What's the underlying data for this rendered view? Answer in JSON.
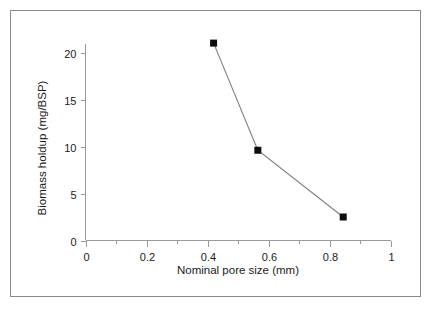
{
  "figure": {
    "frame_color": "#8a8a8a",
    "background_color": "#ffffff",
    "caption": ""
  },
  "chart_data": {
    "type": "line",
    "title": "",
    "subtitle": "",
    "xlabel": "Nominal pore size (mm)",
    "ylabel": "Biomass holdup (mg/BSP)",
    "xlim": [
      0,
      1
    ],
    "ylim": [
      0,
      22
    ],
    "grid": false,
    "legend": null,
    "legend_position": "none",
    "x_ticks": [
      0,
      0.2,
      0.4,
      0.6,
      0.8,
      1
    ],
    "x_tick_labels": [
      "0",
      "0.2",
      "0.4",
      "0.6",
      "0.8",
      "1"
    ],
    "x_minor_ticks": [
      0.1,
      0.3,
      0.5,
      0.7,
      0.9
    ],
    "y_ticks": [
      0,
      5,
      10,
      15,
      20
    ],
    "y_tick_labels": [
      "0",
      "5",
      "10",
      "15",
      "20"
    ],
    "marker": "filled-square",
    "marker_color": "#0d0d0d",
    "line_color": "#7d7d7d",
    "x": [
      0.42,
      0.565,
      0.845
    ],
    "values": [
      21.0,
      9.6,
      2.5
    ],
    "series": [
      {
        "name": "Biomass holdup",
        "x": [
          0.42,
          0.565,
          0.845
        ],
        "values": [
          21.0,
          9.6,
          2.5
        ]
      }
    ],
    "points": [
      {
        "x": 0.42,
        "y": 21.0
      },
      {
        "x": 0.565,
        "y": 9.6
      },
      {
        "x": 0.845,
        "y": 2.5
      }
    ],
    "annotations": []
  }
}
